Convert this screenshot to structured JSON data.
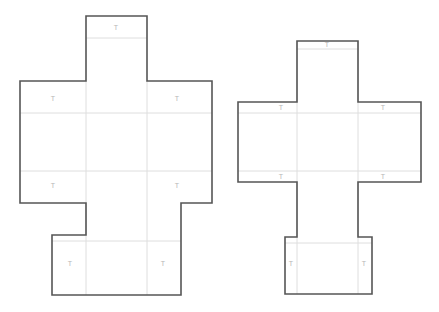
{
  "page": {
    "background_color": "#ffffff",
    "width": 439,
    "height": 312
  },
  "style": {
    "cut_line_color": "#565656",
    "crease_line_color": "#dedede",
    "tab_label_color": "#b6b6b6",
    "panel_fill_color": "#ffffff"
  },
  "diagrams": [
    {
      "id": "net-left",
      "name": "cross-shaped-box-net-left",
      "outline": "M86,16 L147,16 L147,81 L212,81 L212,203 L181,203 L181,235 L181,295 L52,295 L52,235 L86,235 L86,203 L20,203 L20,81 L86,81 Z",
      "creases": [
        {
          "name": "crease-top-flap-fold",
          "d": "M86,38 L147,38"
        },
        {
          "name": "crease-upper-horizontal",
          "d": "M20,113 L212,113"
        },
        {
          "name": "crease-lower-horizontal",
          "d": "M20,171 L212,171"
        },
        {
          "name": "crease-left-vertical",
          "d": "M86,81 L86,235"
        },
        {
          "name": "crease-right-vertical",
          "d": "M147,81 L147,235"
        },
        {
          "name": "crease-bottom-flap-left",
          "d": "M86,235 L86,295"
        },
        {
          "name": "crease-bottom-flap-right",
          "d": "M147,235 L147,295"
        },
        {
          "name": "crease-bottom-flap-top",
          "d": "M52,241 L181,241"
        }
      ],
      "tabs": [
        {
          "name": "tab-label-top",
          "x": 116,
          "y": 28,
          "text": "T"
        },
        {
          "name": "tab-label-upper-left",
          "x": 53,
          "y": 99,
          "text": "T"
        },
        {
          "name": "tab-label-upper-right",
          "x": 177,
          "y": 99,
          "text": "T"
        },
        {
          "name": "tab-label-lower-left",
          "x": 53,
          "y": 186,
          "text": "T"
        },
        {
          "name": "tab-label-lower-right",
          "x": 177,
          "y": 186,
          "text": "T"
        },
        {
          "name": "tab-label-bottom-left",
          "x": 70,
          "y": 264,
          "text": "T"
        },
        {
          "name": "tab-label-bottom-right",
          "x": 163,
          "y": 264,
          "text": "T"
        }
      ]
    },
    {
      "id": "net-right",
      "name": "cross-shaped-box-net-right",
      "outline": "M297,41 L358,41 L358,102 L421,102 L421,182 L358,182 L358,237 L372,237 L372,294 L285,294 L285,237 L297,237 L297,182 L238,182 L238,102 L297,102 Z",
      "creases": [
        {
          "name": "crease-top-flap-fold",
          "d": "M297,49 L358,49"
        },
        {
          "name": "crease-upper-horizontal",
          "d": "M238,113 L421,113"
        },
        {
          "name": "crease-lower-horizontal",
          "d": "M238,171 L421,171"
        },
        {
          "name": "crease-left-vertical",
          "d": "M297,41 L297,294"
        },
        {
          "name": "crease-right-vertical",
          "d": "M358,41 L358,294"
        },
        {
          "name": "crease-bottom-flap-top",
          "d": "M285,243 L372,243"
        }
      ],
      "tabs": [
        {
          "name": "tab-label-top",
          "x": 327,
          "y": 45,
          "text": "T"
        },
        {
          "name": "tab-label-upper-left",
          "x": 281,
          "y": 108,
          "text": "T"
        },
        {
          "name": "tab-label-upper-right",
          "x": 383,
          "y": 108,
          "text": "T"
        },
        {
          "name": "tab-label-lower-left",
          "x": 281,
          "y": 177,
          "text": "T"
        },
        {
          "name": "tab-label-lower-right",
          "x": 383,
          "y": 177,
          "text": "T"
        },
        {
          "name": "tab-label-bottom-left",
          "x": 291,
          "y": 264,
          "text": "T"
        },
        {
          "name": "tab-label-bottom-right",
          "x": 364,
          "y": 264,
          "text": "T"
        }
      ]
    }
  ]
}
